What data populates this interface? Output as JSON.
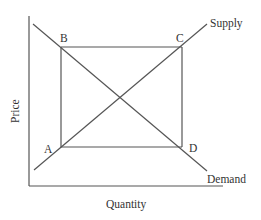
{
  "diagram": {
    "title": "",
    "axes": {
      "x_label": "Quantity",
      "y_label": "Price"
    },
    "curves": [
      {
        "id": "supply",
        "label": "Supply",
        "slope": "upward"
      },
      {
        "id": "demand",
        "label": "Demand",
        "slope": "downward"
      }
    ],
    "points": [
      {
        "id": "A",
        "label": "A",
        "on": "supply",
        "position": "lower-left"
      },
      {
        "id": "B",
        "label": "B",
        "on": "demand",
        "position": "upper-left"
      },
      {
        "id": "C",
        "label": "C",
        "on": "supply",
        "position": "upper-right"
      },
      {
        "id": "D",
        "label": "D",
        "on": "demand",
        "position": "lower-right"
      }
    ],
    "rectangle": [
      "B",
      "C",
      "D",
      "A"
    ],
    "colors": {
      "line": "#555555",
      "text": "#333333",
      "background": "#ffffff"
    }
  }
}
